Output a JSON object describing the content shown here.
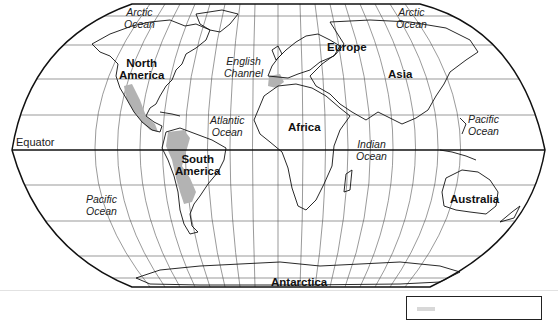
{
  "map": {
    "projection": "Robinson",
    "style": {
      "outline_color": "#111111",
      "grid_color": "#555555",
      "highlight_color": "#b0b0b0",
      "background": "#ffffff"
    },
    "lines": {
      "equator": "Equator"
    },
    "continents": [
      {
        "id": "north-america",
        "line1": "North",
        "line2": "America"
      },
      {
        "id": "south-america",
        "line1": "South",
        "line2": "America"
      },
      {
        "id": "europe",
        "line1": "Europe"
      },
      {
        "id": "asia",
        "line1": "Asia"
      },
      {
        "id": "africa",
        "line1": "Africa"
      },
      {
        "id": "australia",
        "line1": "Australia"
      },
      {
        "id": "antarctica",
        "line1": "Antarctica"
      }
    ],
    "oceans": [
      {
        "id": "arctic-ocean-west",
        "line1": "Arctic",
        "line2": "Ocean"
      },
      {
        "id": "arctic-ocean-east",
        "line1": "Arctic",
        "line2": "Ocean"
      },
      {
        "id": "atlantic-ocean",
        "line1": "Atlantic",
        "line2": "Ocean"
      },
      {
        "id": "pacific-ocean-east",
        "line1": "Pacific",
        "line2": "Ocean"
      },
      {
        "id": "pacific-ocean-west",
        "line1": "Pacific",
        "line2": "Ocean"
      },
      {
        "id": "indian-ocean",
        "line1": "Indian",
        "line2": "Ocean"
      }
    ],
    "features": [
      {
        "id": "english-channel",
        "line1": "English",
        "line2": "Channel"
      }
    ],
    "highlighted_regions": [
      "western North America / Mexico",
      "Central America",
      "Andes (western South America)",
      "Iberian Peninsula"
    ]
  },
  "legend": {
    "visible": "partial"
  }
}
